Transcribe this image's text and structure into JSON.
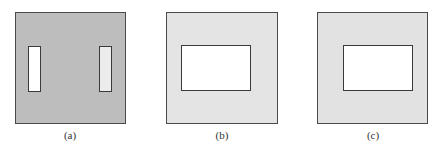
{
  "figure": {
    "panels": [
      {
        "id": "a",
        "label": "(a)",
        "fill": "#bdbdbd",
        "rect": [
          15,
          12,
          111,
          112
        ],
        "holes": [
          {
            "rect": [
              28,
              46,
              13,
              46
            ],
            "fill": "#ffffff"
          },
          {
            "rect": [
              99,
              46,
              13,
              46
            ],
            "fill": "#ececec"
          }
        ]
      },
      {
        "id": "b",
        "label": "(b)",
        "fill": "#e4e4e4",
        "rect": [
          166,
          12,
          112,
          112
        ],
        "holes": [
          {
            "rect": [
              181,
              45,
              70,
              46
            ],
            "fill": "#ffffff"
          }
        ]
      },
      {
        "id": "c",
        "label": "(c)",
        "fill": "#e2e2e2",
        "rect": [
          317,
          12,
          111,
          112
        ],
        "holes": [
          {
            "rect": [
              343,
              45,
              70,
              46
            ],
            "fill": "#ffffff"
          }
        ]
      }
    ]
  }
}
